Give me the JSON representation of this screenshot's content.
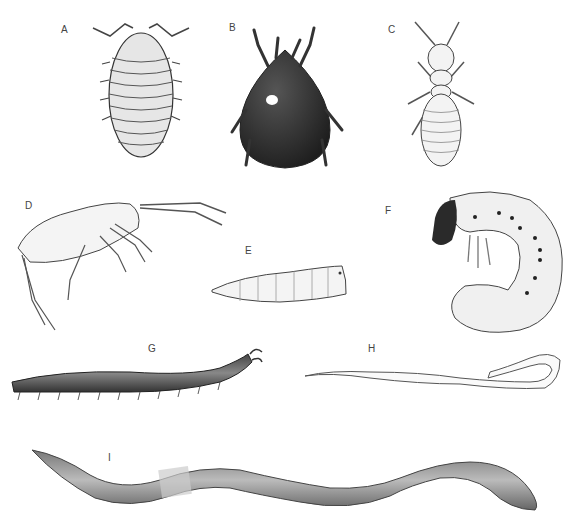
{
  "figure": {
    "panels": [
      {
        "id": "A",
        "label": "A",
        "subject": "woodlouse-dorsal"
      },
      {
        "id": "B",
        "label": "B",
        "subject": "mite-dorsal"
      },
      {
        "id": "C",
        "label": "C",
        "subject": "termite-dorsal"
      },
      {
        "id": "D",
        "label": "D",
        "subject": "springtail-lateral"
      },
      {
        "id": "E",
        "label": "E",
        "subject": "fly-larva"
      },
      {
        "id": "F",
        "label": "F",
        "subject": "beetle-grub"
      },
      {
        "id": "G",
        "label": "G",
        "subject": "millipede"
      },
      {
        "id": "H",
        "label": "H",
        "subject": "pale-worm"
      },
      {
        "id": "I",
        "label": "I",
        "subject": "earthworm"
      }
    ],
    "colors": {
      "background": "#ffffff",
      "ink": "#333333",
      "dark": "#2a2a2a",
      "light": "#f2f2f2"
    }
  }
}
